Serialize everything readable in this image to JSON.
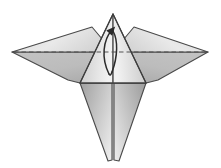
{
  "figure": {
    "name": "origami-crane-step-diagram",
    "title": "Origami folding step diagram",
    "caption": "",
    "background_color": "#ffffff",
    "width": 221,
    "height": 168
  },
  "palette": {
    "stroke": "#4a4a4a",
    "stroke_dark": "#333333",
    "wing_upper_light": "#e9e9e9",
    "wing_upper_mid": "#d8d8d8",
    "wing_lower": "#b9b9b9",
    "wing_lower_dark": "#a8a8a8",
    "body_light": "#efefef",
    "body_mid": "#cfcfcf",
    "tail_light": "#e4e4e4",
    "tail_mid": "#bdbdbd",
    "tail_dark": "#a2a2a2",
    "crease_dashed": "#555555",
    "arrow": "#2b2b2b"
  },
  "geometry": {
    "apex": {
      "x": 113,
      "y": 14
    },
    "left_wing_tip": {
      "x": 12,
      "y": 52
    },
    "right_wing_tip": {
      "x": 208,
      "y": 52
    },
    "left_wing_top_corner": {
      "x": 92,
      "y": 27
    },
    "right_wing_top_corner": {
      "x": 134,
      "y": 27
    },
    "body_left_corner": {
      "x": 80,
      "y": 83
    },
    "body_right_corner": {
      "x": 146,
      "y": 83
    },
    "left_wing_bottom": {
      "x": 68,
      "y": 80
    },
    "right_wing_bottom": {
      "x": 158,
      "y": 80
    },
    "tail_left_tip": {
      "x": 108,
      "y": 161
    },
    "tail_right_tip": {
      "x": 119,
      "y": 161
    },
    "center_line_x": 113,
    "fold_line_y": 52
  },
  "elements": {
    "left_wing_upper": {
      "label": "left wing upper facet"
    },
    "left_wing_lower": {
      "label": "left wing lower facet"
    },
    "right_wing_upper": {
      "label": "right wing upper facet"
    },
    "right_wing_lower": {
      "label": "right wing lower facet"
    },
    "body_triangle": {
      "label": "central body triangle"
    },
    "tail_left": {
      "label": "left tail flap"
    },
    "tail_right": {
      "label": "right tail flap"
    },
    "fold_crease": {
      "label": "horizontal valley fold crease",
      "style": "dashed"
    },
    "center_crease": {
      "label": "vertical center crease",
      "style": "solid"
    },
    "fold_arrow": {
      "label": "curved fold arrow pointing up",
      "style": "curved-arrow"
    }
  },
  "annotations": {
    "step_number": "",
    "instruction": ""
  }
}
